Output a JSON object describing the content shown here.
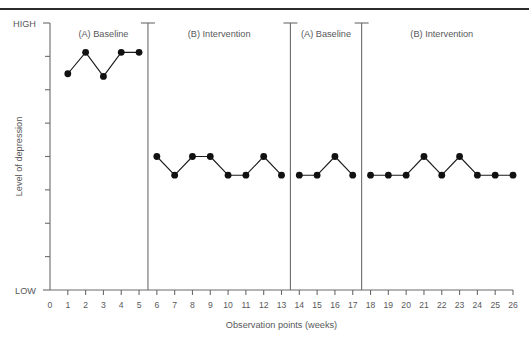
{
  "figure": {
    "top_rule": true,
    "background": "#ffffff",
    "ink_color": "#58585a",
    "marker_color": "#111111"
  },
  "chart_data": {
    "type": "line",
    "title": "",
    "subtitle": "",
    "xlabel": "Observation points (weeks)",
    "ylabel": "Level of depression",
    "ylim": [
      0,
      10
    ],
    "xlim": [
      0,
      26
    ],
    "grid": false,
    "legend": null,
    "y_axis_high_label": "HIGH",
    "y_axis_low_label": "LOW",
    "y_tick_count": 8,
    "x_tick_labels": [
      "0",
      "1",
      "2",
      "3",
      "4",
      "5",
      "6",
      "7",
      "8",
      "9",
      "10",
      "11",
      "12",
      "13",
      "14",
      "15",
      "16",
      "17",
      "18",
      "19",
      "20",
      "21",
      "22",
      "23",
      "24",
      "25",
      "26"
    ],
    "x": [
      1,
      2,
      3,
      4,
      5,
      6,
      7,
      8,
      9,
      10,
      11,
      12,
      13,
      14,
      15,
      16,
      17,
      18,
      19,
      20,
      21,
      22,
      23,
      24,
      25,
      26
    ],
    "values": [
      8.1,
      8.9,
      8.0,
      8.9,
      8.9,
      5.0,
      4.3,
      5.0,
      5.0,
      4.3,
      4.3,
      5.0,
      4.3,
      4.3,
      4.3,
      5.0,
      4.3,
      4.3,
      4.3,
      4.3,
      5.0,
      4.3,
      5.0,
      4.3,
      4.3,
      4.3
    ],
    "phases": [
      {
        "label": "(A) Baseline",
        "x_start": 1,
        "x_end": 5,
        "divider_after": 5.5
      },
      {
        "label": "(B) Intervention",
        "x_start": 6,
        "x_end": 13,
        "divider_after": 13.5
      },
      {
        "label": "(A) Baseline",
        "x_start": 14,
        "x_end": 17,
        "divider_after": 17.5
      },
      {
        "label": "(B) Intervention",
        "x_start": 18,
        "x_end": 26,
        "divider_after": null
      }
    ],
    "series": [
      {
        "name": "Level of depression",
        "segments": [
          {
            "phase": "(A) Baseline",
            "x": [
              1,
              2,
              3,
              4,
              5
            ],
            "values": [
              8.1,
              8.9,
              8.0,
              8.9,
              8.9
            ]
          },
          {
            "phase": "(B) Intervention",
            "x": [
              6,
              7,
              8,
              9,
              10,
              11,
              12,
              13
            ],
            "values": [
              5.0,
              4.3,
              5.0,
              5.0,
              4.3,
              4.3,
              5.0,
              4.3
            ]
          },
          {
            "phase": "(A) Baseline",
            "x": [
              14,
              15,
              16,
              17
            ],
            "values": [
              4.3,
              4.3,
              5.0,
              4.3
            ]
          },
          {
            "phase": "(B) Intervention",
            "x": [
              18,
              19,
              20,
              21,
              22,
              23,
              24,
              25,
              26
            ],
            "values": [
              4.3,
              4.3,
              4.3,
              5.0,
              4.3,
              5.0,
              4.3,
              4.3,
              4.3
            ]
          }
        ]
      }
    ]
  }
}
